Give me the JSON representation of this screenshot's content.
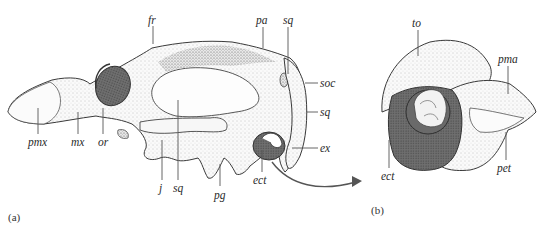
{
  "figure": {
    "panels": [
      {
        "id": "a",
        "label": "(a)",
        "description": "Lateral view of skull",
        "structures": [
          {
            "abbr": "fr"
          },
          {
            "abbr": "pa"
          },
          {
            "abbr": "sq",
            "position": "top"
          },
          {
            "abbr": "soc"
          },
          {
            "abbr": "sq",
            "position": "right"
          },
          {
            "abbr": "ex"
          },
          {
            "abbr": "pmx"
          },
          {
            "abbr": "mx"
          },
          {
            "abbr": "or"
          },
          {
            "abbr": "j"
          },
          {
            "abbr": "sq",
            "position": "bottom"
          },
          {
            "abbr": "pg"
          },
          {
            "abbr": "ect"
          }
        ]
      },
      {
        "id": "b",
        "label": "(b)",
        "description": "Enlarged auditory region",
        "structures": [
          {
            "abbr": "to"
          },
          {
            "abbr": "pma"
          },
          {
            "abbr": "pet"
          },
          {
            "abbr": "ect"
          }
        ]
      }
    ],
    "colors": {
      "ectotympanic_fill": "#6e6e6e",
      "ink": "#2b2b2b",
      "bone_fill": "#f4f4f4",
      "stipple": "#9a9a9a"
    }
  }
}
